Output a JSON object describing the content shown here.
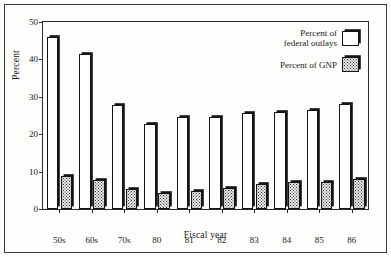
{
  "chart_data": {
    "type": "bar",
    "title": "",
    "xlabel": "Fiscal year",
    "ylabel": "Percent",
    "categories": [
      "50s",
      "60s",
      "70s",
      "80",
      "81",
      "82",
      "83",
      "84",
      "85",
      "86"
    ],
    "series": [
      {
        "name": "Percent of federal outlays",
        "values": [
          46.0,
          41.5,
          27.7,
          22.7,
          24.5,
          24.7,
          25.6,
          26.0,
          26.5,
          28.0
        ]
      },
      {
        "name": "Percent of GNP",
        "values": [
          8.8,
          7.8,
          5.3,
          4.3,
          4.7,
          5.5,
          6.7,
          7.2,
          7.3,
          8.1
        ]
      }
    ],
    "ylim": [
      0,
      50
    ],
    "yticks": [
      0,
      10,
      20,
      30,
      40,
      50
    ],
    "ytick_labels": [
      "0",
      "10",
      "20",
      "30",
      "40",
      "50"
    ],
    "grid": false,
    "legend_position": "top-right"
  },
  "legend": {
    "entries": [
      {
        "label_line1": "Percent of",
        "label_line2": "federal outlays",
        "swatch": "hollow-white-swatch"
      },
      {
        "label_line1": "Percent of GNP",
        "label_line2": "",
        "swatch": "stippled-gray-swatch"
      }
    ]
  },
  "colors": {
    "bar_outline": "#141414",
    "bar_outlays_fill": "#ffffff",
    "bar_gnp_fill": "#e8e8e8",
    "axis": "#2a2a2a",
    "background": "#fdfdfb",
    "text": "#1a1a1a"
  }
}
